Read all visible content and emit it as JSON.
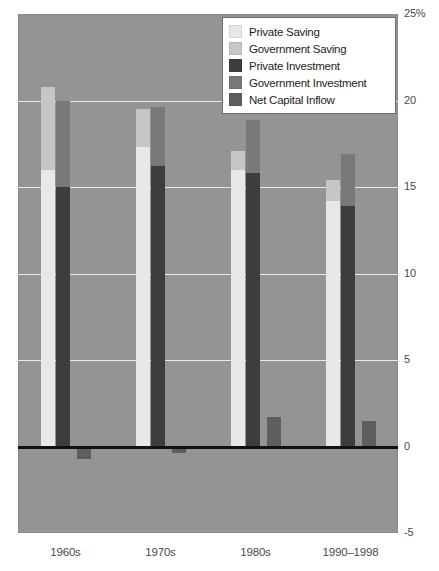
{
  "chart_data": {
    "type": "bar",
    "title": "",
    "subtitle": "",
    "xlabel": "",
    "ylabel": "",
    "ylim": [
      -5,
      25
    ],
    "yticks": [
      25,
      20,
      15,
      10,
      5,
      0,
      -5
    ],
    "ytick_labels": [
      "25%",
      "20",
      "15",
      "10",
      "5",
      "0",
      "-5"
    ],
    "grid": true,
    "legend_position": "top-right",
    "categories": [
      "1960s",
      "1970s",
      "1980s",
      "1990–1998"
    ],
    "series": [
      {
        "name": "Private Saving",
        "color": "#e8e8e5",
        "values": [
          16.0,
          17.3,
          16.0,
          14.2
        ]
      },
      {
        "name": "Government Saving",
        "color": "#c6c6c3",
        "values": [
          4.8,
          2.2,
          1.1,
          1.2
        ]
      },
      {
        "name": "Private Investment",
        "color": "#3d3d3d",
        "values": [
          15.0,
          16.2,
          15.8,
          13.9
        ]
      },
      {
        "name": "Government Investment",
        "color": "#797979",
        "values": [
          5.0,
          3.4,
          3.1,
          3.0
        ]
      },
      {
        "name": "Net Capital Inflow",
        "color": "#5e5e5e",
        "values": [
          -0.7,
          -0.35,
          1.7,
          1.5
        ]
      }
    ],
    "stacks": [
      {
        "name": "Saving",
        "components": [
          "Private Saving",
          "Government Saving"
        ],
        "totals": [
          20.8,
          19.5,
          17.1,
          15.4
        ]
      },
      {
        "name": "Investment",
        "components": [
          "Private Investment",
          "Government Investment"
        ],
        "totals": [
          20.0,
          19.6,
          18.9,
          16.9
        ]
      }
    ]
  },
  "legend": {
    "items": [
      {
        "label": "Private Saving",
        "color": "#e8e8e5"
      },
      {
        "label": "Government Saving",
        "color": "#c6c6c3"
      },
      {
        "label": "Private Investment",
        "color": "#3d3d3d"
      },
      {
        "label": "Government Investment",
        "color": "#797979"
      },
      {
        "label": "Net Capital Inflow",
        "color": "#5e5e5e"
      }
    ]
  },
  "axis": {
    "y_labels": [
      "25%",
      "20",
      "15",
      "10",
      "5",
      "0",
      "-5"
    ],
    "x_labels": [
      "1960s",
      "1970s",
      "1980s",
      "1990–1998"
    ]
  },
  "colors": {
    "plot_background": "#949494",
    "gridline": "#e9e9e9",
    "zeroline": "#111111",
    "tick_text": "#4a4a4a",
    "legend_background": "#ffffff",
    "legend_border": "#6f6f6f"
  }
}
